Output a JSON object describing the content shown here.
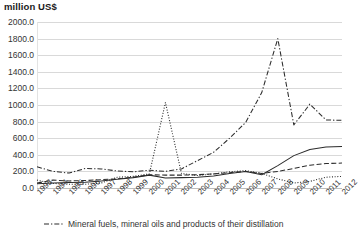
{
  "chart_data": {
    "type": "line",
    "title": "million US$",
    "xlabel": "",
    "ylabel": "million US$",
    "ylim": [
      0,
      2000
    ],
    "ytick_step": 200,
    "grid": true,
    "legend_position": "bottom",
    "x": [
      1993,
      1994,
      1995,
      1996,
      1997,
      1998,
      1999,
      2000,
      2001,
      2002,
      2003,
      2004,
      2005,
      2006,
      2007,
      2008,
      2009,
      2010,
      2011,
      2012
    ],
    "ytick_labels": [
      "0.0",
      "200.0",
      "400.0",
      "600.0",
      "800.0",
      "1000.0",
      "1200.0",
      "1400.0",
      "1600.0",
      "1800.0",
      "2000.0"
    ],
    "xtick_labels": [
      "1993",
      "1994",
      "1995",
      "1996",
      "1997",
      "1998",
      "1999",
      "2000",
      "2001",
      "2002",
      "2003",
      "2004",
      "2005",
      "2006",
      "2007",
      "2008",
      "2009",
      "2010",
      "2011",
      "2012"
    ],
    "series": [
      {
        "name": "Mineral fuels, mineral oils and products of their distillation",
        "style": "dash-dot",
        "color": "#2b2b2b",
        "values": [
          255,
          200,
          180,
          235,
          230,
          205,
          195,
          215,
          200,
          230,
          330,
          430,
          600,
          790,
          1150,
          1800,
          760,
          1010,
          820,
          815
        ]
      },
      {
        "name": "series-dotted",
        "style": "dotted",
        "color": "#4a4a4a",
        "values": [
          95,
          55,
          45,
          45,
          60,
          130,
          140,
          170,
          1030,
          175,
          150,
          170,
          195,
          210,
          175,
          110,
          60,
          80,
          130,
          140
        ]
      },
      {
        "name": "series-solid",
        "style": "solid",
        "color": "#2b2b2b",
        "values": [
          50,
          60,
          65,
          70,
          85,
          105,
          125,
          155,
          120,
          125,
          130,
          145,
          175,
          200,
          160,
          270,
          390,
          465,
          495,
          500
        ]
      },
      {
        "name": "series-dashed",
        "style": "dashed",
        "color": "#2b2b2b",
        "values": [
          60,
          95,
          85,
          90,
          100,
          110,
          130,
          160,
          155,
          155,
          160,
          170,
          185,
          200,
          175,
          200,
          235,
          275,
          295,
          300
        ]
      }
    ],
    "legend": [
      {
        "label": "Mineral fuels, mineral oils and products of their distillation",
        "style": "dash-dot"
      }
    ]
  }
}
